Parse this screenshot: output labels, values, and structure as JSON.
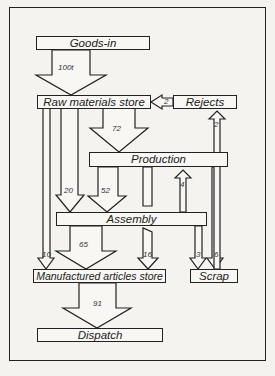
{
  "nodes": {
    "goods_in": "Goods-in",
    "raw_materials": "Raw materials store",
    "rejects": "Rejects",
    "production": "Production",
    "assembly": "Assembly",
    "manufactured": "Manufactured articles store",
    "scrap": "Scrap",
    "dispatch": "Dispatch"
  },
  "flows": {
    "goods_to_raw": "100t",
    "rejects_to_raw": "2",
    "scrap_to_rejects": "2",
    "raw_to_production": "72",
    "raw_to_assembly": "20",
    "production_to_assembly": "52",
    "assembly_to_production": "4",
    "assembly_to_manufactured": "65",
    "raw_to_manufactured": "10",
    "production_to_manufactured": "16",
    "assembly_to_scrap": "3",
    "raw_to_scrap": "6",
    "manufactured_to_dispatch": "91"
  }
}
